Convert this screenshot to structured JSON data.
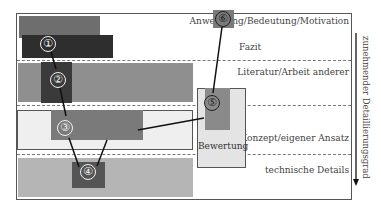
{
  "diagram": {
    "levels": [
      {
        "id": "motivation",
        "label": "Anwendung/Bedeutung/Motivation"
      },
      {
        "id": "fazit",
        "label": "Fazit"
      },
      {
        "id": "literatur",
        "label": "Literatur/Arbeit anderer"
      },
      {
        "id": "konzept",
        "label": "Konzept/eigener Ansatz"
      },
      {
        "id": "technisch",
        "label": "technische Details"
      }
    ],
    "bewertung_label": "Bewertung",
    "axis_label": "zunehmender Detaillierungsgrad",
    "steps": [
      "①",
      "②",
      "③",
      "④",
      "⑤",
      "⑥"
    ],
    "colors": {
      "dark": "#2e2e2e",
      "medium": "#6e6e6e",
      "mid_light": "#8a8a8a",
      "light": "#b8b8b8",
      "pale": "#ececec",
      "box_dark": "#555555"
    }
  }
}
